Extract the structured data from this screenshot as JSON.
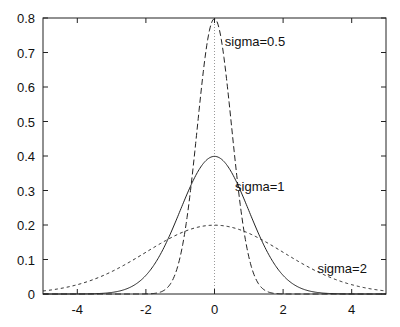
{
  "chart_data": {
    "type": "line",
    "title": "",
    "xlabel": "",
    "ylabel": "",
    "xlim": [
      -5,
      5
    ],
    "ylim": [
      0,
      0.8
    ],
    "grid": false,
    "legend": "inline labels",
    "x_ticks": [
      -4,
      -2,
      0,
      2,
      4
    ],
    "x_tick_labels": [
      "-4",
      "-2",
      "0",
      "2",
      "4"
    ],
    "y_ticks": [
      0,
      0.1,
      0.2,
      0.3,
      0.4,
      0.5,
      0.6,
      0.7,
      0.8
    ],
    "y_tick_labels": [
      "0",
      "0.1",
      "0.2",
      "0.3",
      "0.4",
      "0.5",
      "0.6",
      "0.7",
      "0.8"
    ],
    "series": [
      {
        "name": "sigma=0.5",
        "function": "normal_pdf",
        "mu": 0,
        "sigma": 0.5,
        "style": "dashed",
        "peak": 0.798
      },
      {
        "name": "sigma=1",
        "function": "normal_pdf",
        "mu": 0,
        "sigma": 1,
        "style": "solid",
        "peak": 0.399
      },
      {
        "name": "sigma=2",
        "function": "normal_pdf",
        "mu": 0,
        "sigma": 2,
        "style": "dotted-dash",
        "peak": 0.199
      }
    ],
    "annotations": [
      {
        "text": "sigma=0.5",
        "x": 0.3,
        "y": 0.72
      },
      {
        "text": "sigma=1",
        "x": 0.6,
        "y": 0.3
      },
      {
        "text": "sigma=2",
        "x": 3.0,
        "y": 0.06
      }
    ],
    "reference_line": {
      "x": 0,
      "style": "dotted"
    }
  }
}
